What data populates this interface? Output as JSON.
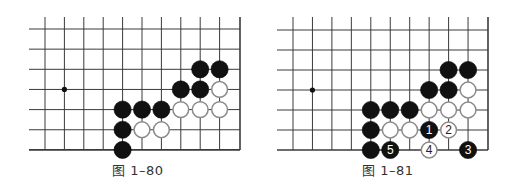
{
  "diagrams": [
    {
      "caption": "图 1–80",
      "grid": {
        "left": 45,
        "top": 29,
        "dx": 19.4,
        "dy": 20.15,
        "cols": 10,
        "rows": 7,
        "line_left": 29,
        "line_top": 17,
        "right_edge": 240
      },
      "hoshi": [
        {
          "col": 1,
          "row": 3
        }
      ],
      "stones": [
        {
          "col": 8,
          "row": 2,
          "color": "black"
        },
        {
          "col": 9,
          "row": 2,
          "color": "black"
        },
        {
          "col": 7,
          "row": 3,
          "color": "black"
        },
        {
          "col": 8,
          "row": 3,
          "color": "black"
        },
        {
          "col": 9,
          "row": 3,
          "color": "white"
        },
        {
          "col": 4,
          "row": 4,
          "color": "black"
        },
        {
          "col": 5,
          "row": 4,
          "color": "black"
        },
        {
          "col": 6,
          "row": 4,
          "color": "black"
        },
        {
          "col": 7,
          "row": 4,
          "color": "white"
        },
        {
          "col": 8,
          "row": 4,
          "color": "white"
        },
        {
          "col": 9,
          "row": 4,
          "color": "white"
        },
        {
          "col": 4,
          "row": 5,
          "color": "black"
        },
        {
          "col": 5,
          "row": 5,
          "color": "white"
        },
        {
          "col": 6,
          "row": 5,
          "color": "white"
        },
        {
          "col": 4,
          "row": 6,
          "color": "black"
        }
      ]
    },
    {
      "caption": "图 1–81",
      "grid": {
        "left": 293,
        "top": 30,
        "dx": 19.45,
        "dy": 20.0,
        "cols": 10,
        "rows": 7,
        "line_left": 277,
        "line_top": 17,
        "right_edge": 488
      },
      "hoshi": [
        {
          "col": 1,
          "row": 3
        }
      ],
      "stones": [
        {
          "col": 8,
          "row": 2,
          "color": "black"
        },
        {
          "col": 9,
          "row": 2,
          "color": "black"
        },
        {
          "col": 7,
          "row": 3,
          "color": "black"
        },
        {
          "col": 8,
          "row": 3,
          "color": "black"
        },
        {
          "col": 9,
          "row": 3,
          "color": "white"
        },
        {
          "col": 4,
          "row": 4,
          "color": "black"
        },
        {
          "col": 5,
          "row": 4,
          "color": "black"
        },
        {
          "col": 6,
          "row": 4,
          "color": "black"
        },
        {
          "col": 7,
          "row": 4,
          "color": "white"
        },
        {
          "col": 8,
          "row": 4,
          "color": "white"
        },
        {
          "col": 9,
          "row": 4,
          "color": "white"
        },
        {
          "col": 4,
          "row": 5,
          "color": "black"
        },
        {
          "col": 5,
          "row": 5,
          "color": "white"
        },
        {
          "col": 6,
          "row": 5,
          "color": "white"
        },
        {
          "col": 7,
          "row": 5,
          "color": "black",
          "label": "1"
        },
        {
          "col": 8,
          "row": 5,
          "color": "white",
          "label": "2"
        },
        {
          "col": 4,
          "row": 6,
          "color": "black"
        },
        {
          "col": 5,
          "row": 6,
          "color": "black",
          "label": "5"
        },
        {
          "col": 7,
          "row": 6,
          "color": "white",
          "label": "4"
        },
        {
          "col": 9,
          "row": 6,
          "color": "black",
          "label": "3"
        }
      ]
    }
  ],
  "colors": {
    "line": "#3a3a3a",
    "black_stone": "#111111",
    "white_stone_fill": "#ffffff",
    "white_stone_border": "#8a8a8a",
    "caption": "#333333"
  }
}
